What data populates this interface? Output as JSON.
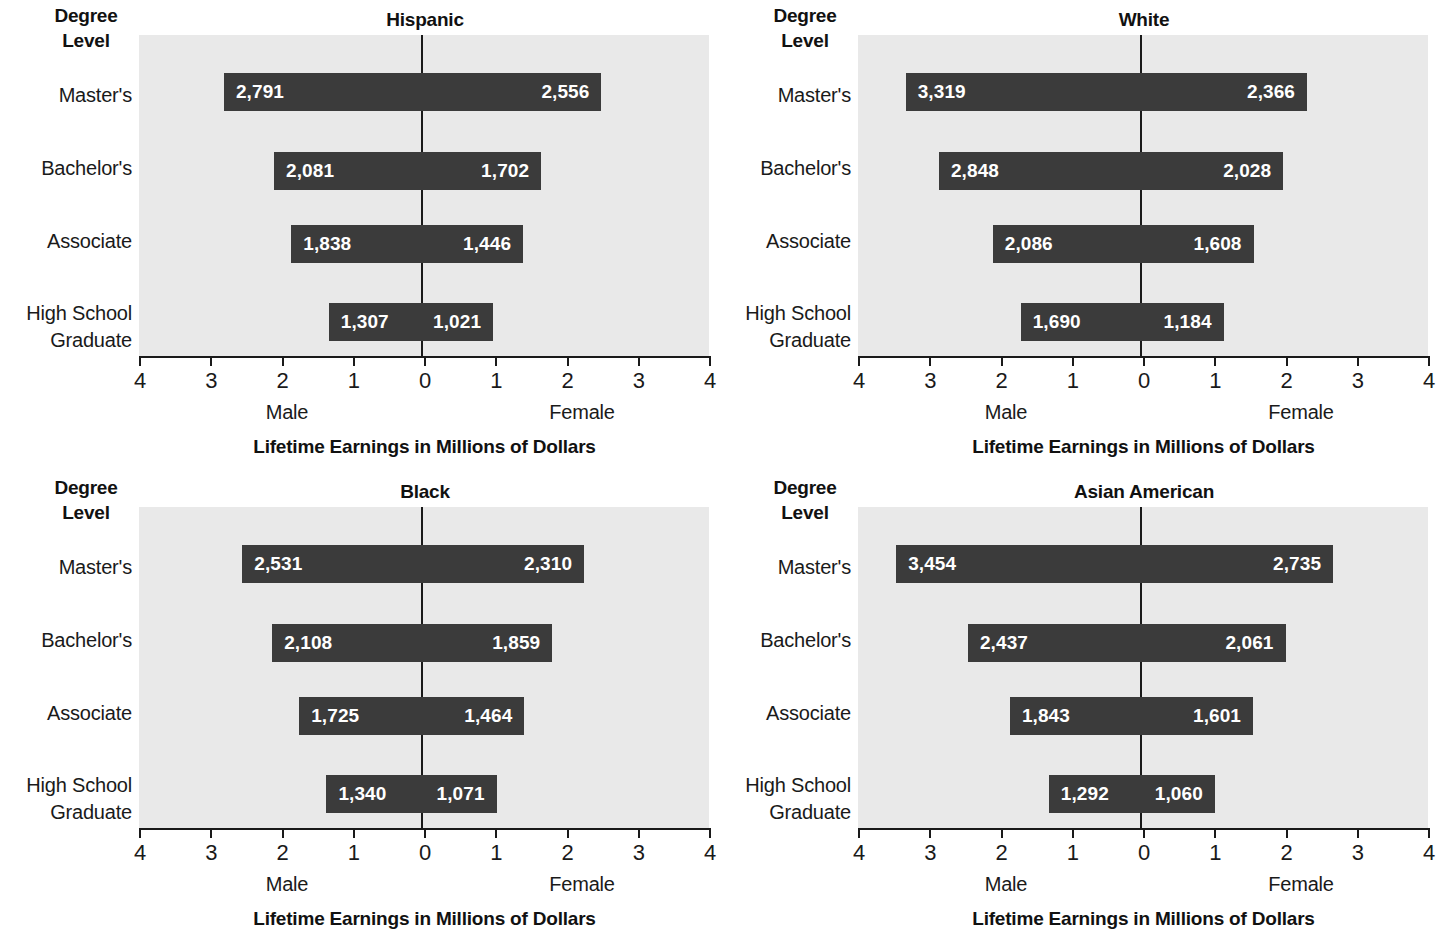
{
  "figure": {
    "degree_header_lines": [
      "Degree",
      "Level"
    ],
    "axis_title": "Lifetime Earnings in Millions of Dollars",
    "male_label": "Male",
    "female_label": "Female",
    "row_labels": [
      [
        "Master's"
      ],
      [
        "Bachelor's"
      ],
      [
        "Associate"
      ],
      [
        "High School",
        "Graduate"
      ]
    ],
    "tick_labels": [
      "4",
      "3",
      "2",
      "1",
      "0",
      "1",
      "2",
      "3",
      "4"
    ],
    "colors": {
      "bar": "#3b3b3b",
      "plot_background": "#e9e9e9",
      "axis": "#1a1a1a",
      "value_text": "#ffffff",
      "page_background": "#ffffff"
    }
  },
  "chart_data": {
    "type": "bar",
    "subtype": "diverging-bidirectional-bar",
    "xlabel": "Lifetime Earnings in Millions of Dollars",
    "ylabel": "Degree Level",
    "xlim": [
      -4,
      4
    ],
    "xticks": [
      4,
      3,
      2,
      1,
      0,
      1,
      2,
      3,
      4
    ],
    "grid": false,
    "legend": "none",
    "units": "thousands of dollars (bar labels) / millions of dollars (axis)",
    "categories": [
      "Master's",
      "Bachelor's",
      "Associate",
      "High School Graduate"
    ],
    "direction_labels": {
      "left": "Male",
      "right": "Female"
    },
    "panels": [
      {
        "title": "Hispanic",
        "series": [
          {
            "name": "Male",
            "values": [
              2791,
              2081,
              1838,
              1307
            ],
            "labels": [
              "2,791",
              "2,081",
              "1,838",
              "1,307"
            ]
          },
          {
            "name": "Female",
            "values": [
              2556,
              1702,
              1446,
              1021
            ],
            "labels": [
              "2,556",
              "1,702",
              "1,446",
              "1,021"
            ]
          }
        ]
      },
      {
        "title": "White",
        "series": [
          {
            "name": "Male",
            "values": [
              3319,
              2848,
              2086,
              1690
            ],
            "labels": [
              "3,319",
              "2,848",
              "2,086",
              "1,690"
            ]
          },
          {
            "name": "Female",
            "values": [
              2366,
              2028,
              1608,
              1184
            ],
            "labels": [
              "2,366",
              "2,028",
              "1,608",
              "1,184"
            ]
          }
        ]
      },
      {
        "title": "Black",
        "series": [
          {
            "name": "Male",
            "values": [
              2531,
              2108,
              1725,
              1340
            ],
            "labels": [
              "2,531",
              "2,108",
              "1,725",
              "1,340"
            ]
          },
          {
            "name": "Female",
            "values": [
              2310,
              1859,
              1464,
              1071
            ],
            "labels": [
              "2,310",
              "1,859",
              "1,464",
              "1,071"
            ]
          }
        ]
      },
      {
        "title": "Asian American",
        "series": [
          {
            "name": "Male",
            "values": [
              3454,
              2437,
              1843,
              1292
            ],
            "labels": [
              "3,454",
              "2,437",
              "1,843",
              "1,292"
            ]
          },
          {
            "name": "Female",
            "values": [
              2735,
              2061,
              1601,
              1060
            ],
            "labels": [
              "2,735",
              "2,061",
              "1,601",
              "1,060"
            ]
          }
        ]
      }
    ]
  }
}
